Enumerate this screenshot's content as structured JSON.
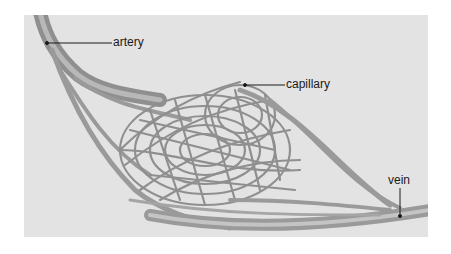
{
  "diagram": {
    "labels": {
      "artery": "artery",
      "capillary": "capillary",
      "vein": "vein"
    },
    "colors": {
      "panel": "#e3e3e3",
      "vessel": "#9a9a9a",
      "vessel_light": "#c4c4c4",
      "leader_line": "#1a1a1a"
    }
  }
}
